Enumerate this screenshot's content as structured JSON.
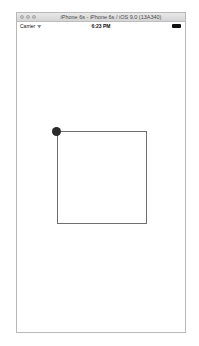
{
  "window": {
    "title": "iPhone 6s - iPhone 6s / iOS 9.0 (13A340)"
  },
  "status_bar": {
    "carrier": "Carrier ᯤ",
    "time": "6:23 PM",
    "battery_icon": "battery-full-icon"
  },
  "canvas": {
    "shape": "square",
    "handle": "drag-handle-dot",
    "colors": {
      "stroke": "#6e6e6e",
      "handle": "#2b2b2b"
    }
  }
}
